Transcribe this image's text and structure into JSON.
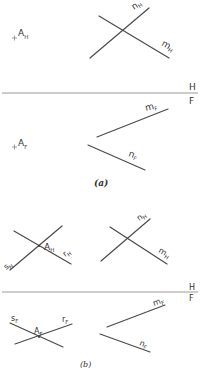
{
  "figure": {
    "part_a": {
      "caption": "(a)",
      "fold_line": {
        "top_label": "H",
        "bottom_label": "F"
      },
      "point": {
        "top": {
          "name": "A",
          "sub": "H"
        },
        "front": {
          "name": "A",
          "sub": "F"
        }
      },
      "lines_top": [
        {
          "name": "n",
          "sub": "H"
        },
        {
          "name": "m",
          "sub": "H"
        }
      ],
      "lines_front": [
        {
          "name": "m",
          "sub": "F"
        },
        {
          "name": "n",
          "sub": "F"
        }
      ]
    },
    "part_b": {
      "caption": "(b)",
      "fold_line": {
        "top_label": "H",
        "bottom_label": "F"
      },
      "point": {
        "top": {
          "name": "A",
          "sub": "H"
        },
        "front": {
          "name": "A",
          "sub": "F"
        }
      },
      "construct_top": [
        {
          "name": "s",
          "sub": "H"
        },
        {
          "name": "r",
          "sub": "H"
        }
      ],
      "construct_front": [
        {
          "name": "s",
          "sub": "F"
        },
        {
          "name": "r",
          "sub": "F"
        }
      ],
      "lines_top": [
        {
          "name": "n",
          "sub": "H"
        },
        {
          "name": "m",
          "sub": "H"
        }
      ],
      "lines_front": [
        {
          "name": "m",
          "sub": "F"
        },
        {
          "name": "n",
          "sub": "F"
        }
      ]
    }
  }
}
